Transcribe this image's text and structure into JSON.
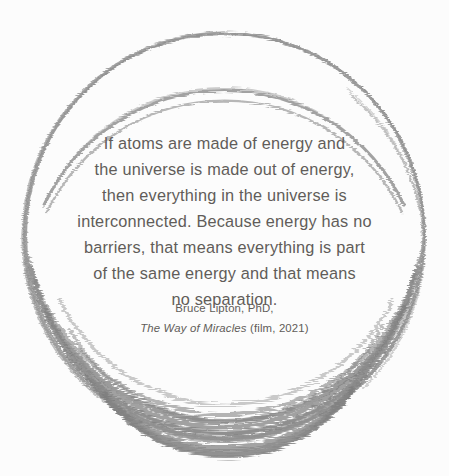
{
  "canvas": {
    "width": 449,
    "height": 476,
    "background_color": "#fcfcfc"
  },
  "decoration": {
    "shape_name": "hand-drawn-circle",
    "stroke_color": "#8f8f8f",
    "stroke_color_dense": "#7e7e7e",
    "stroke_color_light": "#a9a9a9",
    "center_x": 224,
    "center_y": 236,
    "radius": 200
  },
  "quote": {
    "lines": [
      "If atoms are made of energy and",
      "the universe is made out of energy,",
      "then everything in the universe is",
      "interconnected. Because energy has no",
      "barriers, that means everything is part",
      "of the same energy and that means",
      "no separation."
    ],
    "text_color": "#615c59"
  },
  "attribution": {
    "author": "Bruce Lipton, PhD,",
    "source_title": "The Way of Miracles",
    "source_medium": "(film, 2021)",
    "text_color": "#615c59"
  }
}
